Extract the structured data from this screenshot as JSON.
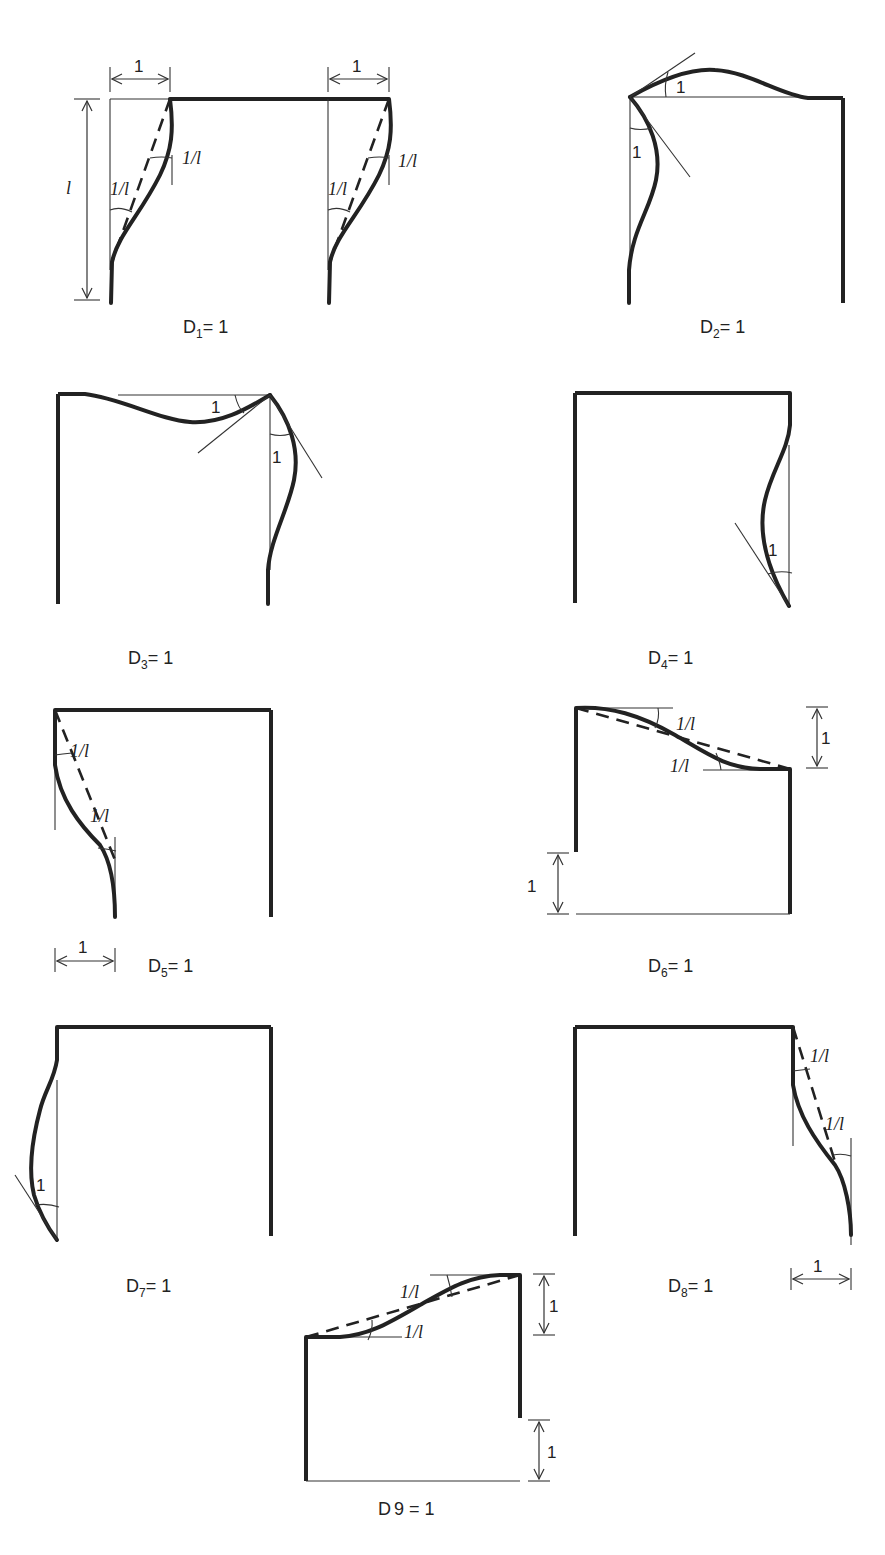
{
  "figure": {
    "panels": [
      {
        "id": "D1",
        "caption_main": "D",
        "caption_sub": "1",
        "caption_rest": "= 1",
        "labels": {
          "width_left": "1",
          "width_right": "1",
          "height": "l",
          "rot_top_left": "1/l",
          "rot_bottom_left": "1/l",
          "rot_top_right": "1/l",
          "rot_bottom_right": "1/l"
        }
      },
      {
        "id": "D2",
        "caption_main": "D",
        "caption_sub": "2",
        "caption_rest": "= 1",
        "labels": {
          "rot_beam": "1",
          "rot_column": "1"
        }
      },
      {
        "id": "D3",
        "caption_main": "D",
        "caption_sub": "3",
        "caption_rest": "= 1",
        "labels": {
          "rot_beam": "1",
          "rot_column": "1"
        }
      },
      {
        "id": "D4",
        "caption_main": "D",
        "caption_sub": "4",
        "caption_rest": "= 1",
        "labels": {
          "rot_base": "1"
        }
      },
      {
        "id": "D5",
        "caption_main": "D",
        "caption_sub": "5",
        "caption_rest": "= 1",
        "labels": {
          "rot_top": "1/l",
          "rot_bottom": "1/l",
          "width": "1"
        }
      },
      {
        "id": "D6",
        "caption_main": "D",
        "caption_sub": "6",
        "caption_rest": "= 1",
        "labels": {
          "rot_left": "1/l",
          "rot_right": "1/l",
          "drop_right": "1",
          "drop_base": "1"
        }
      },
      {
        "id": "D7",
        "caption_main": "D",
        "caption_sub": "7",
        "caption_rest": "= 1",
        "labels": {
          "rot_base": "1"
        }
      },
      {
        "id": "D8",
        "caption_main": "D",
        "caption_sub": "8",
        "caption_rest": "= 1",
        "labels": {
          "rot_top": "1/l",
          "rot_bottom": "1/l",
          "width": "1"
        }
      },
      {
        "id": "D9",
        "caption_main": "D",
        "caption_sub": "",
        "caption_rest": "9 = 1",
        "labels": {
          "rot_right": "1/l",
          "rot_left": "1/l",
          "rise_right": "1",
          "drop_base": "1"
        }
      }
    ]
  }
}
